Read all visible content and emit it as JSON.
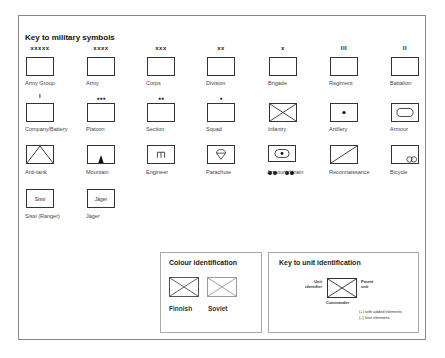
{
  "title": "Key to military symbols",
  "rows": [
    [
      {
        "label": "Army Group",
        "marker": "xxxxx",
        "symbol": "blank"
      },
      {
        "label": "Army",
        "marker": "xxxx",
        "symbol": "blank"
      },
      {
        "label": "Corps",
        "marker": "xxx",
        "symbol": "blank"
      },
      {
        "label": "Division",
        "marker": "xx",
        "symbol": "blank"
      },
      {
        "label": "Brigade",
        "marker": "x",
        "symbol": "blank"
      },
      {
        "label": "Regiment",
        "marker": "III",
        "symbol": "blank"
      },
      {
        "label": "Battalion",
        "marker": "II",
        "symbol": "blank"
      }
    ],
    [
      {
        "label": "Company/Battery",
        "marker": "I",
        "symbol": "blank"
      },
      {
        "label": "Platoon",
        "marker": "●●●",
        "symbol": "blank"
      },
      {
        "label": "Section",
        "marker": "●●",
        "symbol": "blank"
      },
      {
        "label": "Squad",
        "marker": "●",
        "symbol": "blank"
      },
      {
        "label": "Infantry",
        "marker": "",
        "symbol": "cross"
      },
      {
        "label": "Artillery",
        "marker": "",
        "symbol": "dot"
      },
      {
        "label": "Armour",
        "marker": "",
        "symbol": "oval"
      }
    ],
    [
      {
        "label": "Anti-tank",
        "marker": "",
        "symbol": "triangle"
      },
      {
        "label": "Mountain",
        "marker": "",
        "symbol": "mountain"
      },
      {
        "label": "Engineer",
        "marker": "",
        "symbol": "engineer"
      },
      {
        "label": "Parachute",
        "marker": "",
        "symbol": "parachute"
      },
      {
        "label": "Armoured train",
        "marker": "",
        "symbol": "train"
      },
      {
        "label": "Reconnaissance",
        "marker": "",
        "symbol": "diagonal"
      },
      {
        "label": "Bicycle",
        "marker": "",
        "symbol": "bicycle"
      }
    ],
    [
      {
        "label": "Sissi (Ranger)",
        "marker": "",
        "symbol": "text",
        "box_text": "Sissi"
      },
      {
        "label": "Jäger",
        "marker": "",
        "symbol": "text",
        "box_text": "Jäger"
      }
    ]
  ],
  "colour_identification": {
    "title": "Colour identification",
    "items": [
      {
        "label": "Finnish",
        "stroke": "#555555"
      },
      {
        "label": "Soviet",
        "stroke": "#9a9a9a"
      }
    ]
  },
  "unit_key": {
    "title": "Key to unit identification",
    "left_label_1": "Unit",
    "left_label_2": "identifier",
    "right_label_1": "Parent",
    "right_label_2": "unit",
    "bottom_label": "Commander",
    "note_1": "(+) with added elements",
    "note_2": "(–) less elements"
  }
}
